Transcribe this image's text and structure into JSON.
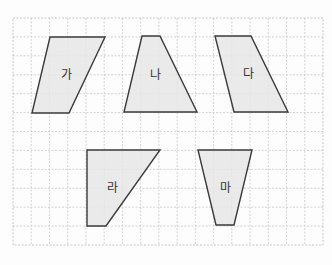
{
  "diagram": {
    "colors": {
      "background": "#fdfdfd",
      "grid_line": "#c9c9c9",
      "shape_fill": "#e6e6e6",
      "shape_stroke": "#3a3a3a",
      "label": "#333333"
    },
    "grid": {
      "left": 13,
      "top": 18,
      "right": 323,
      "bottom": 245,
      "columns": 17,
      "rows": 12
    },
    "shapes": [
      {
        "id": "ga",
        "label": "가",
        "points": "50,37 105,37 69,113 32,113",
        "label_x": 66,
        "label_y": 75
      },
      {
        "id": "na",
        "label": "나",
        "points": "142,36 160,36 197,112 124,112",
        "label_x": 155,
        "label_y": 75
      },
      {
        "id": "da",
        "label": "다",
        "points": "215,36 251,36 288,112 234,112",
        "label_x": 248,
        "label_y": 74
      },
      {
        "id": "ra",
        "label": "라",
        "points": "87,150 160,150 106,226 87,226",
        "label_x": 112,
        "label_y": 188
      },
      {
        "id": "ma",
        "label": "마",
        "points": "198,150 252,150 234,225 216,225",
        "label_x": 225,
        "label_y": 188
      }
    ]
  }
}
